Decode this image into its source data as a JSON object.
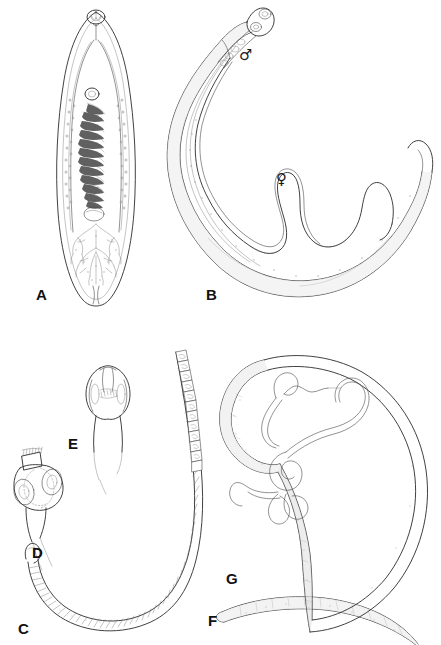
{
  "figure": {
    "background_color": "#ffffff",
    "ink_color": "#2b2b2b",
    "width": 441,
    "height": 645,
    "panel_count": 7
  },
  "panels": [
    {
      "id": "A",
      "label": "A",
      "label_x": 36,
      "label_y": 287,
      "subject": "trematode-fluke-whole-mount",
      "description": "Dorsoventrally flattened leaf-shaped fluke with oral sucker, ventral sucker, coiled egg-filled uterus and branched testes"
    },
    {
      "id": "B",
      "label": "B",
      "label_x": 206,
      "label_y": 287,
      "subject": "schistosome-pair-in-copula",
      "description": "Male worm with gynecophoric canal holding the longer slender female"
    },
    {
      "id": "C",
      "label": "C",
      "label_x": 18,
      "label_y": 621,
      "subject": "tapeworm-strobila",
      "description": "Segmented tapeworm strobila of gravid proglottids"
    },
    {
      "id": "D",
      "label": "D",
      "label_x": 32,
      "label_y": 545,
      "subject": "armed-scolex",
      "description": "Scolex with rostellum bearing a crown of hooks and four cup-shaped suckers"
    },
    {
      "id": "E",
      "label": "E",
      "label_x": 68,
      "label_y": 436,
      "subject": "bothriate-scolex",
      "description": "Elongate scolex with paired longitudinal bothria"
    },
    {
      "id": "F",
      "label": "F",
      "label_x": 208,
      "label_y": 613,
      "subject": "nematode-female",
      "description": "Large stout roundworm with tapered ends"
    },
    {
      "id": "G",
      "label": "G",
      "label_x": 226,
      "label_y": 571,
      "subject": "nematode-male-coiled-tail",
      "description": "Roundworm with ventrally curved coiled posterior end and spicules"
    }
  ],
  "annotations": {
    "male_symbol": {
      "glyph": "♂",
      "name": "male-sex-symbol",
      "x": 239,
      "y": 48,
      "panel": "B"
    },
    "female_symbol": {
      "glyph": "♀",
      "name": "female-sex-symbol",
      "x": 276,
      "y": 172,
      "panel": "B"
    }
  }
}
